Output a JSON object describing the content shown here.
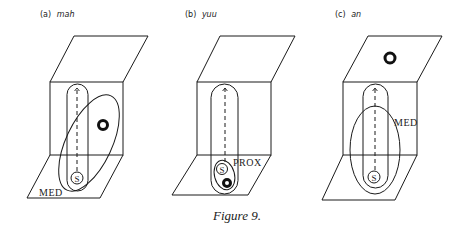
{
  "figure": {
    "caption": "Figure 9.",
    "panels": [
      {
        "id": "a",
        "letter": "(a)",
        "word": "mah",
        "region_label": "MED",
        "speaker_label": "S",
        "object_position": "vertical plane, right of path, inside medial region"
      },
      {
        "id": "b",
        "letter": "(b)",
        "word": "yuu",
        "region_label": "PROX",
        "speaker_label": "S",
        "object_position": "ground plane, beside speaker, inside proximal region"
      },
      {
        "id": "c",
        "letter": "(c)",
        "word": "an",
        "region_label": "MED",
        "speaker_label": "S",
        "object_position": "upper plane, outside medial region"
      }
    ]
  },
  "colors": {
    "ink": "#1a1a1a",
    "background": "#ffffff"
  }
}
